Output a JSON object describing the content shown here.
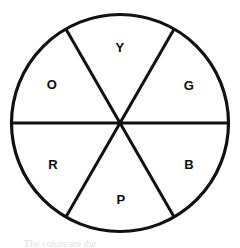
{
  "figure": {
    "title": "",
    "caption_fragment": "The colors are the",
    "shape": "circle",
    "stroke_color": "#111111",
    "fill_color": "#ffffff",
    "stroke_width_px": 3,
    "divider_width_px": 3,
    "center": {
      "x": 120,
      "y": 123
    },
    "radius_px": 109,
    "sector_count": 6,
    "sectors": [
      {
        "id": "yellow",
        "label": "Y",
        "angle_deg": 90,
        "label_x": 120,
        "label_y": 48,
        "start_deg": 60,
        "end_deg": 120
      },
      {
        "id": "green",
        "label": "G",
        "angle_deg": 30,
        "label_x": 189,
        "label_y": 86,
        "start_deg": 0,
        "end_deg": 60
      },
      {
        "id": "blue",
        "label": "B",
        "angle_deg": -30,
        "label_x": 189,
        "label_y": 165,
        "start_deg": -60,
        "end_deg": 0
      },
      {
        "id": "purple",
        "label": "P",
        "angle_deg": -90,
        "label_x": 120,
        "label_y": 200,
        "start_deg": -120,
        "end_deg": -60
      },
      {
        "id": "red",
        "label": "R",
        "angle_deg": 210,
        "label_x": 53,
        "label_y": 165,
        "start_deg": 180,
        "end_deg": 240
      },
      {
        "id": "orange",
        "label": "O",
        "angle_deg": 150,
        "label_x": 53,
        "label_y": 86,
        "start_deg": 120,
        "end_deg": 180
      }
    ],
    "dividers": [
      {
        "id": "horizontal-diameter",
        "x1": 11,
        "y1": 123,
        "x2": 229,
        "y2": 123
      },
      {
        "id": "diagonal-nw-se",
        "x1": 65,
        "y1": 29,
        "x2": 175,
        "y2": 217
      },
      {
        "id": "diagonal-ne-sw",
        "x1": 175,
        "y1": 29,
        "x2": 65,
        "y2": 217
      }
    ]
  }
}
